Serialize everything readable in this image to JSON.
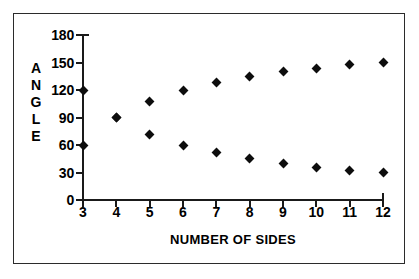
{
  "chart_data": {
    "type": "scatter",
    "title": "",
    "subtitle": "",
    "xlabel": "NUMBER OF SIDES",
    "ylabel": "ANGLE",
    "ylabel_letters": [
      "A",
      "N",
      "G",
      "L",
      "E"
    ],
    "x": [
      3,
      4,
      5,
      6,
      7,
      8,
      9,
      10,
      11,
      12
    ],
    "xtick_labels": [
      "3",
      "4",
      "5",
      "6",
      "7",
      "8",
      "9",
      "10",
      "11",
      "12"
    ],
    "ytick_labels": [
      "180",
      "150",
      "120",
      "90",
      "60",
      "30",
      "0"
    ],
    "ytick_values": [
      180,
      150,
      120,
      90,
      60,
      30,
      0
    ],
    "xlim": [
      3,
      12
    ],
    "ylim": [
      0,
      180
    ],
    "grid": false,
    "legend": "none",
    "marker": "diamond",
    "marker_color": "#000000",
    "series": [
      {
        "name": "interior angle",
        "values": [
          60,
          90,
          108,
          120,
          128.6,
          135,
          140,
          144,
          147.3,
          150
        ]
      },
      {
        "name": "exterior angle",
        "values": [
          120,
          90,
          72,
          60,
          51.4,
          45,
          40,
          36,
          32.7,
          30
        ]
      }
    ]
  },
  "figure": {
    "border_color": "#2b2b2b",
    "background": "#ffffff",
    "axis_color": "#1a1a1a"
  }
}
